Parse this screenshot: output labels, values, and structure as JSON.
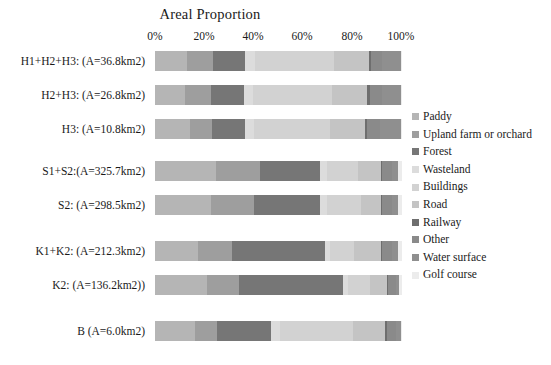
{
  "chart_data": {
    "type": "bar",
    "orientation": "horizontal",
    "stacked": true,
    "title": "Areal Proportion",
    "xlabel": "",
    "ylabel": "",
    "xlim": [
      0,
      100
    ],
    "grid": false,
    "legend_position": "right",
    "x_tick_labels": [
      "0%",
      "20%",
      "40%",
      "60%",
      "80%",
      "100%"
    ],
    "x_tick_values": [
      0,
      20,
      40,
      60,
      80,
      100
    ],
    "categories": [
      "H1+H2+H3: (A=36.8km2)",
      "H2+H3: (A=26.8km2)",
      "H3: (A=10.8km2)",
      "S1+S2:(A=325.7km2)",
      "S2: (A=298.5km2)",
      "K1+K2: (A=212.3km2)",
      "K2: (A=136.2km2))",
      "B (A=6.0km2)"
    ],
    "series": [
      {
        "name": "Paddy",
        "color": "#b5b5b5",
        "values": [
          13.0,
          12.0,
          14.0,
          24.5,
          22.5,
          17.5,
          21.0,
          16.0
        ]
      },
      {
        "name": "Upland farm or orchard",
        "color": "#9e9e9e",
        "values": [
          10.5,
          10.5,
          9.0,
          18.0,
          17.5,
          13.5,
          13.0,
          9.0
        ]
      },
      {
        "name": "Forest",
        "color": "#767676",
        "values": [
          13.0,
          13.5,
          13.5,
          24.5,
          27.0,
          38.0,
          42.0,
          22.0
        ]
      },
      {
        "name": "Wasteland",
        "color": "#dcdcdc",
        "values": [
          4.0,
          3.5,
          3.5,
          2.5,
          2.5,
          2.0,
          2.0,
          3.5
        ]
      },
      {
        "name": "Buildings",
        "color": "#d2d2d2",
        "values": [
          32.0,
          32.0,
          31.0,
          12.5,
          14.0,
          9.5,
          9.0,
          29.5
        ]
      },
      {
        "name": "Road",
        "color": "#c4c4c4",
        "values": [
          14.0,
          14.5,
          14.0,
          9.5,
          8.0,
          11.0,
          7.0,
          13.0
        ]
      },
      {
        "name": "Railway",
        "color": "#6e6e6e",
        "values": [
          1.0,
          1.0,
          1.0,
          0.5,
          0.5,
          0.5,
          0.5,
          1.0
        ]
      },
      {
        "name": "Other",
        "color": "#8a8a8a",
        "values": [
          4.5,
          5.0,
          5.0,
          4.0,
          4.0,
          4.0,
          3.0,
          3.5
        ]
      },
      {
        "name": "Water surface",
        "color": "#8f8f8f",
        "values": [
          7.5,
          7.5,
          8.5,
          2.5,
          2.5,
          2.5,
          1.5,
          2.0
        ]
      },
      {
        "name": "Golf course",
        "color": "#ececec",
        "values": [
          0.5,
          0.5,
          0.5,
          1.5,
          1.5,
          1.5,
          1.0,
          0.5
        ]
      }
    ]
  },
  "layout": {
    "bar_rows": [
      {
        "top": 51,
        "height": 20
      },
      {
        "top": 85,
        "height": 20
      },
      {
        "top": 119,
        "height": 20
      },
      {
        "top": 161,
        "height": 20
      },
      {
        "top": 195,
        "height": 20
      },
      {
        "top": 241,
        "height": 20
      },
      {
        "top": 275,
        "height": 20
      },
      {
        "top": 321,
        "height": 20
      }
    ],
    "x_tick_px": [
      155,
      204,
      253,
      302,
      352,
      401
    ]
  }
}
